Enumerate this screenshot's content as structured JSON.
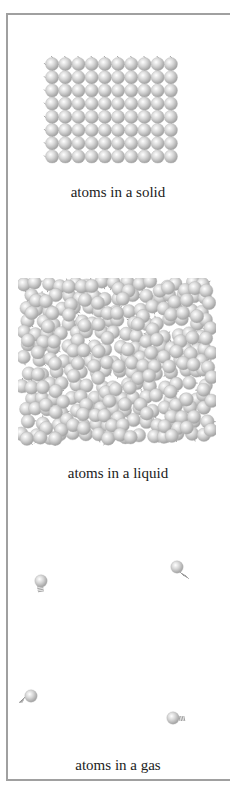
{
  "figure": {
    "panels": [
      {
        "id": "solid",
        "caption": "atoms in a solid",
        "layout": {
          "columns": 10,
          "rows": 8
        }
      },
      {
        "id": "liquid",
        "caption": "atoms in a liquid"
      },
      {
        "id": "gas",
        "caption": "atoms in a gas",
        "atom_count": 4
      }
    ]
  },
  "colors": {
    "frame": "#a0a0a0",
    "atom_highlight": "#ffffff",
    "atom_mid": "#d6d6d6",
    "atom_shadow": "#9a9a9a",
    "caption": "#222222"
  }
}
